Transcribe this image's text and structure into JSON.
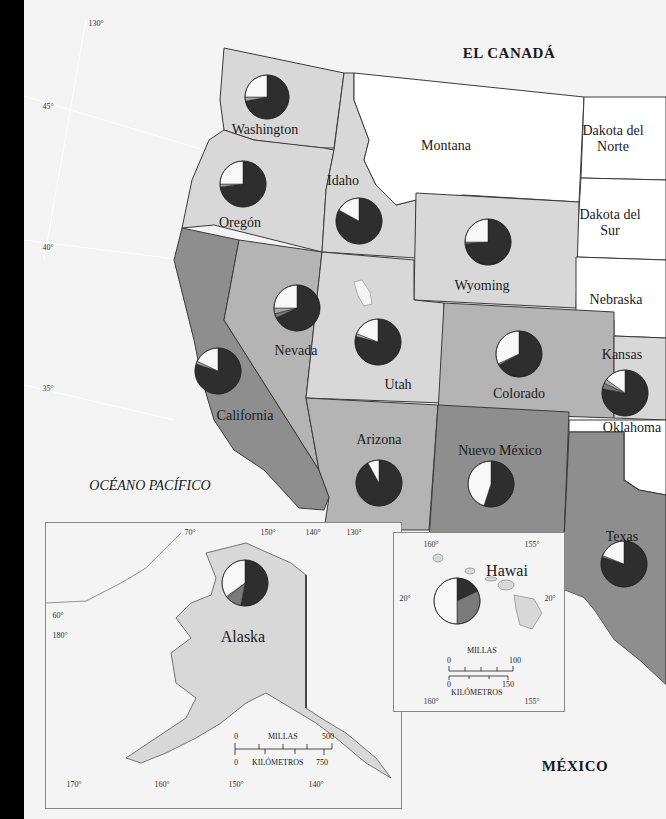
{
  "map": {
    "countries": {
      "canada": "EL CANADÁ",
      "mexico": "MÉXICO"
    },
    "ocean": "OCÉANO PACÍFICO",
    "states": {
      "washington": "Washington",
      "oregon": "Oregón",
      "idaho": "Idaho",
      "montana": "Montana",
      "north_dakota": "Dakota del\nNorte",
      "north_dakota_l1": "Dakota del",
      "north_dakota_l2": "Norte",
      "south_dakota_l1": "Dakota del",
      "south_dakota_l2": "Sur",
      "wyoming": "Wyoming",
      "nebraska": "Nebraska",
      "california": "California",
      "nevada": "Nevada",
      "utah": "Utah",
      "colorado": "Colorado",
      "kansas": "Kansas",
      "oklahoma": "Oklahoma",
      "arizona": "Arizona",
      "new_mexico": "Nuevo México",
      "texas": "Texas",
      "alaska": "Alaska",
      "hawaii": "Hawai"
    },
    "coordinates": {
      "main": {
        "lon_130": "130°",
        "lat_45": "45°",
        "lat_40": "40°",
        "lat_35": "35°"
      },
      "alaska": {
        "top": [
          "70°",
          "150°",
          "140°",
          "130°"
        ],
        "left": [
          "60°",
          "180°"
        ],
        "bottom": [
          "170°",
          "160°",
          "150°",
          "140°"
        ]
      },
      "hawaii": {
        "top": [
          "160°",
          "155°"
        ],
        "side": [
          "20°",
          "20°"
        ],
        "bottom": [
          "160°",
          "155°"
        ]
      }
    },
    "scales": {
      "alaska": {
        "miles_label": "MILLAS",
        "miles_min": "0",
        "miles_max": "500",
        "km_label": "KILÓMETROS",
        "km_min": "0",
        "km_max": "750"
      },
      "hawaii": {
        "miles_label": "MILLAS",
        "miles_min": "0",
        "miles_max": "100",
        "km_label": "KILÓMETROS",
        "km_min": "0",
        "km_max": "150"
      }
    },
    "colors": {
      "ocean": "#f4f4f4",
      "unshaded": "#ffffff",
      "light": "#d8d8d8",
      "medium": "#b4b4b4",
      "dark": "#8e8e8e",
      "border": "#3a3a3a",
      "slice_dark": "#2e2e2e",
      "slice_medium": "#7a7a7a",
      "slice_light": "#a8a8a8",
      "slice_white": "#f8f8f8"
    }
  },
  "chart_data": {
    "type": "pie",
    "title": "",
    "note": "Pie charts per western state; slices ordered clockwise from 12 o'clock. Values are estimated shares (%) read from slice angles. Categories are unlabeled in the image.",
    "categories": [
      "dark",
      "medium",
      "light",
      "white"
    ],
    "series": [
      {
        "name": "Washington",
        "values": [
          72,
          0,
          3,
          25
        ]
      },
      {
        "name": "Oregón",
        "values": [
          73,
          0,
          2,
          25
        ]
      },
      {
        "name": "Idaho",
        "values": [
          83,
          0,
          0,
          17
        ]
      },
      {
        "name": "Wyoming",
        "values": [
          74,
          0,
          1,
          25
        ]
      },
      {
        "name": "California",
        "values": [
          80,
          0,
          2,
          18
        ]
      },
      {
        "name": "Nevada",
        "values": [
          68,
          3,
          4,
          25
        ]
      },
      {
        "name": "Utah",
        "values": [
          79,
          0,
          2,
          19
        ]
      },
      {
        "name": "Colorado",
        "values": [
          67,
          0,
          1,
          32
        ]
      },
      {
        "name": "Kansas",
        "values": [
          78,
          4,
          3,
          15
        ]
      },
      {
        "name": "Arizona",
        "values": [
          92,
          0,
          0,
          8
        ]
      },
      {
        "name": "Nuevo México",
        "values": [
          55,
          0,
          0,
          45
        ]
      },
      {
        "name": "Texas",
        "values": [
          80,
          0,
          1,
          19
        ]
      },
      {
        "name": "Alaska",
        "values": [
          53,
          11,
          1,
          35
        ]
      },
      {
        "name": "Hawai",
        "values": [
          18,
          32,
          0,
          50
        ]
      }
    ]
  }
}
